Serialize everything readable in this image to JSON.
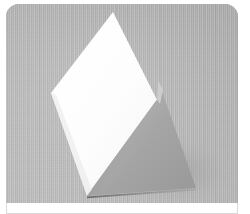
{
  "thumbnail": {
    "name": "photo-thumbnail-card",
    "corner_radius_px": 13,
    "page_background": "#ffffff"
  },
  "photo": {
    "alt": "folded white paper card standing upright on a gray studio backdrop",
    "subject": "folded-card",
    "frame": {
      "x": 6,
      "y": 4,
      "width": 232,
      "height": 199
    },
    "backdrop": {
      "name": "gray-studio-backdrop",
      "base_color": "#b7b7b7",
      "top_color": "#aeaeae",
      "bottom_color": "#c2c2c2",
      "texture": "fine vertical weave"
    },
    "object": {
      "front_face": {
        "name": "white-front-panel",
        "fill": "#fbfbfb",
        "highlight": "#ffffff",
        "vertices": [
          {
            "x": 113,
            "y": 12
          },
          {
            "x": 157,
            "y": 100
          },
          {
            "x": 87,
            "y": 196
          },
          {
            "x": 51,
            "y": 93
          }
        ]
      },
      "back_face": {
        "name": "gray-back-panel",
        "fill": "#a9a9a9",
        "shade_light": "#bdbdbd",
        "shade_dark": "#989898",
        "vertices": [
          {
            "x": 158,
            "y": 80
          },
          {
            "x": 196,
            "y": 188
          },
          {
            "x": 87,
            "y": 196
          },
          {
            "x": 157,
            "y": 100
          }
        ]
      },
      "fold_edge": {
        "name": "center-fold-crease",
        "from": {
          "x": 157,
          "y": 100
        },
        "to": {
          "x": 87,
          "y": 196
        },
        "color": "#8f8f8f"
      },
      "contact_shadow": {
        "name": "ground-contact-shadow",
        "color": "#6f6f6f",
        "from": {
          "x": 87,
          "y": 197
        },
        "to": {
          "x": 196,
          "y": 189
        }
      }
    }
  },
  "caption": {
    "name": "caption-band",
    "text": "",
    "border_color": "#d9d9d9",
    "background": "#ffffff"
  }
}
